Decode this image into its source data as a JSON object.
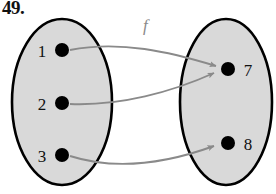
{
  "problem": {
    "number": "49."
  },
  "diagram": {
    "function_label": "f",
    "domain_set": {
      "name": "domain-ellipse",
      "elements": [
        {
          "label": "1",
          "cx": 62,
          "cy": 50
        },
        {
          "label": "2",
          "cx": 62,
          "cy": 103
        },
        {
          "label": "3",
          "cx": 62,
          "cy": 155
        }
      ]
    },
    "codomain_set": {
      "name": "codomain-ellipse",
      "elements": [
        {
          "label": "7",
          "cx": 228,
          "cy": 69
        },
        {
          "label": "8",
          "cx": 228,
          "cy": 143
        }
      ]
    },
    "mappings": [
      {
        "from": "1",
        "to": "7"
      },
      {
        "from": "2",
        "to": "7"
      },
      {
        "from": "3",
        "to": "8"
      }
    ],
    "colors": {
      "set_fill": "#d9d9d9",
      "set_outline": "#000000",
      "point": "#000000",
      "arrow": "#8a8a8a",
      "text": "#111111"
    }
  }
}
